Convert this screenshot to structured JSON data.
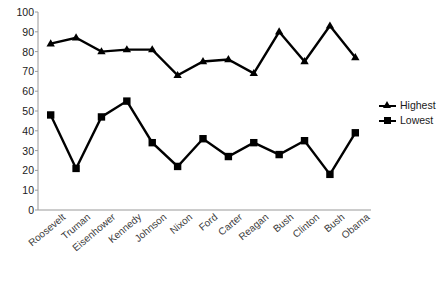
{
  "chart_data": {
    "type": "line",
    "title": "",
    "xlabel": "",
    "ylabel": "",
    "ylim": [
      0,
      100
    ],
    "ytick_step": 10,
    "grid": false,
    "legend_position": "right",
    "categories": [
      "Roosevelt",
      "Truman",
      "Eisenhower",
      "Kennedy",
      "Johnson",
      "Nixon",
      "Ford",
      "Carter",
      "Reagan",
      "Bush",
      "Clinton",
      "Bush",
      "Obama"
    ],
    "yticks": [
      0,
      10,
      20,
      30,
      40,
      50,
      60,
      70,
      80,
      90,
      100
    ],
    "series": [
      {
        "name": "Highest",
        "marker": "triangle",
        "color": "#000000",
        "values": [
          84,
          87,
          80,
          81,
          81,
          68,
          75,
          76,
          69,
          90,
          75,
          93,
          77
        ]
      },
      {
        "name": "Lowest",
        "marker": "square",
        "color": "#000000",
        "values": [
          48,
          21,
          47,
          55,
          34,
          22,
          36,
          27,
          34,
          28,
          35,
          18,
          39
        ]
      }
    ]
  },
  "legend": {
    "entries": [
      {
        "label": "Highest",
        "marker": "triangle-marker-icon"
      },
      {
        "label": "Lowest",
        "marker": "square-marker-icon"
      }
    ]
  }
}
